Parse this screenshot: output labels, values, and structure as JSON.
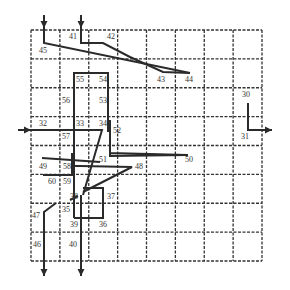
{
  "diagram": {
    "type": "grid-routing",
    "grid": {
      "columns": 8,
      "rows": 8,
      "left": 31,
      "top": 30,
      "right": 262,
      "bottom": 261,
      "line_style": "dashed",
      "line_color": "#333333"
    },
    "colors": {
      "path": "#2a2a2a",
      "label": "#333333",
      "background": "#ffffff"
    },
    "labels": [
      {
        "text": "41",
        "x": 73,
        "y": 37
      },
      {
        "text": "42",
        "x": 111,
        "y": 37
      },
      {
        "text": "45",
        "x": 43,
        "y": 51
      },
      {
        "text": "43",
        "x": 161,
        "y": 80
      },
      {
        "text": "44",
        "x": 189,
        "y": 80
      },
      {
        "text": "55",
        "x": 80,
        "y": 80
      },
      {
        "text": "54",
        "x": 103,
        "y": 80
      },
      {
        "text": "56",
        "x": 66,
        "y": 101
      },
      {
        "text": "53",
        "x": 103,
        "y": 101
      },
      {
        "text": "30",
        "x": 246,
        "y": 95
      },
      {
        "text": "31",
        "x": 245,
        "y": 137
      },
      {
        "text": "32",
        "x": 43,
        "y": 124
      },
      {
        "text": "33",
        "x": 80,
        "y": 124
      },
      {
        "text": "34",
        "x": 103,
        "y": 124
      },
      {
        "text": "52",
        "x": 117,
        "y": 131
      },
      {
        "text": "57",
        "x": 66,
        "y": 137
      },
      {
        "text": "51",
        "x": 103,
        "y": 160
      },
      {
        "text": "50",
        "x": 189,
        "y": 160
      },
      {
        "text": "48",
        "x": 139,
        "y": 167
      },
      {
        "text": "49",
        "x": 43,
        "y": 167
      },
      {
        "text": "58",
        "x": 67,
        "y": 167
      },
      {
        "text": "60",
        "x": 52,
        "y": 182
      },
      {
        "text": "59",
        "x": 67,
        "y": 182
      },
      {
        "text": "38",
        "x": 74,
        "y": 197
      },
      {
        "text": "37",
        "x": 111,
        "y": 197
      },
      {
        "text": "35",
        "x": 66,
        "y": 210
      },
      {
        "text": "47",
        "x": 36,
        "y": 216
      },
      {
        "text": "39",
        "x": 74,
        "y": 225
      },
      {
        "text": "36",
        "x": 103,
        "y": 225
      },
      {
        "text": "46",
        "x": 37,
        "y": 245
      },
      {
        "text": "40",
        "x": 73,
        "y": 245
      }
    ],
    "paths": [
      {
        "name": "net-45-44",
        "points": [
          [
            44,
            15
          ],
          [
            44,
            43
          ],
          [
            190,
            73
          ]
        ],
        "start_arrow": "down-in"
      },
      {
        "name": "net-41-43",
        "points": [
          [
            81,
            15
          ],
          [
            81,
            43
          ],
          [
            103,
            43
          ],
          [
            130,
            57
          ],
          [
            163,
            72
          ],
          [
            190,
            73
          ]
        ],
        "start_arrow": "down-in"
      },
      {
        "name": "net-55-52",
        "points": [
          [
            74,
            218
          ],
          [
            74,
            73
          ],
          [
            108,
            73
          ],
          [
            108,
            117
          ],
          [
            108,
            132
          ]
        ]
      },
      {
        "name": "net-32-33",
        "points": [
          [
            18,
            130
          ],
          [
            102,
            130
          ],
          [
            83,
            195
          ]
        ],
        "start_arrow": "right-in"
      },
      {
        "name": "net-52-51-50",
        "points": [
          [
            110,
            120
          ],
          [
            110,
            153
          ],
          [
            188,
            155
          ],
          [
            110,
            156
          ],
          [
            110,
            153
          ]
        ]
      },
      {
        "name": "net-49-51",
        "points": [
          [
            42,
            158
          ],
          [
            100,
            162
          ]
        ]
      },
      {
        "name": "net-58-48",
        "points": [
          [
            72,
            166
          ],
          [
            80,
            166
          ],
          [
            132,
            167
          ],
          [
            83,
            192
          ]
        ]
      },
      {
        "name": "net-60-59",
        "points": [
          [
            43,
            175
          ],
          [
            72,
            175
          ],
          [
            72,
            153
          ]
        ]
      },
      {
        "name": "net-37-box",
        "points": [
          [
            83,
            188
          ],
          [
            103,
            188
          ],
          [
            103,
            218
          ],
          [
            74,
            218
          ]
        ]
      },
      {
        "name": "net-38-35",
        "points": [
          [
            70,
            200
          ],
          [
            78,
            196
          ]
        ]
      },
      {
        "name": "net-35-47-46",
        "points": [
          [
            56,
            203
          ],
          [
            44,
            212
          ],
          [
            44,
            276
          ]
        ],
        "end_arrow": "down-out"
      },
      {
        "name": "net-40",
        "points": [
          [
            81,
            195
          ],
          [
            81,
            276
          ]
        ],
        "end_arrow": "down-out"
      },
      {
        "name": "net-30-31",
        "points": [
          [
            248,
            103
          ],
          [
            248,
            130
          ],
          [
            272,
            130
          ]
        ],
        "end_arrow": "right-out"
      }
    ]
  }
}
